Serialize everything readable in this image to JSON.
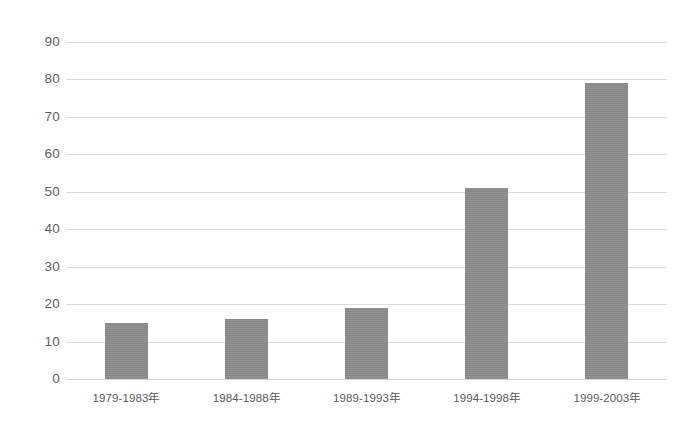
{
  "chart_data": {
    "type": "bar",
    "title": "",
    "subtitle": "",
    "xlabel": "",
    "ylabel": "",
    "categories": [
      "1979-1983年",
      "1984-1988年",
      "1989-1993年",
      "1994-1998年",
      "1999-2003年"
    ],
    "values": [
      15,
      16,
      19,
      51,
      79
    ],
    "series": [
      {
        "name": "",
        "values": [
          15,
          16,
          19,
          51,
          79
        ]
      }
    ],
    "ylim": [
      0,
      90
    ],
    "ytick_step": 10,
    "yticks": [
      "90",
      "80",
      "70",
      "60",
      "50",
      "40",
      "30",
      "20",
      "10",
      "0"
    ],
    "ytick_values": [
      90,
      80,
      70,
      60,
      50,
      40,
      30,
      20,
      10,
      0
    ],
    "grid": true,
    "grid_axis": "y",
    "legend": false,
    "legend_position": "none",
    "bar_color": "#8b8b8b",
    "grid_color": "#dcdcdc",
    "text_color": "#5a5a5a",
    "background_color": "#ffffff"
  }
}
